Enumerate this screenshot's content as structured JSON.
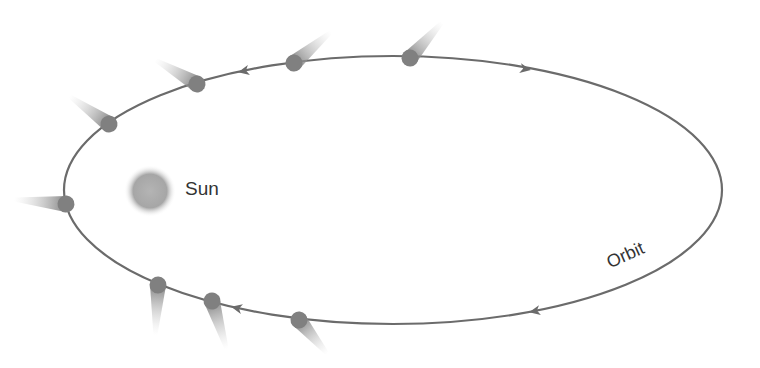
{
  "diagram": {
    "labels": {
      "sun": "Sun",
      "orbit": "Orbit"
    },
    "colors": {
      "orbit_line": "#6b6b6b",
      "comet_head": "#808080",
      "sun": "#a8a8a8",
      "text": "#333333",
      "background": "#ffffff"
    },
    "orbit": {
      "cx": 393,
      "cy": 190,
      "rx": 329,
      "ry": 134
    },
    "sun": {
      "cx": 150,
      "cy": 191,
      "r": 24
    },
    "comets": [
      {
        "x": 410,
        "y": 58,
        "tail_angle": -48,
        "tail_length": 48
      },
      {
        "x": 294,
        "y": 63,
        "tail_angle": -40,
        "tail_length": 48
      },
      {
        "x": 197,
        "y": 84,
        "tail_angle": -150,
        "tail_length": 48
      },
      {
        "x": 109,
        "y": 124,
        "tail_angle": -145,
        "tail_length": 48
      },
      {
        "x": 66,
        "y": 204,
        "tail_angle": 185,
        "tail_length": 52
      },
      {
        "x": 158,
        "y": 285,
        "tail_angle": 93,
        "tail_length": 50
      },
      {
        "x": 212,
        "y": 301,
        "tail_angle": 73,
        "tail_length": 50
      },
      {
        "x": 299,
        "y": 320,
        "tail_angle": 50,
        "tail_length": 44
      }
    ],
    "arrows": [
      {
        "x": 244,
        "y": 71,
        "direction": "left"
      },
      {
        "x": 525,
        "y": 69,
        "direction": "right"
      },
      {
        "x": 535,
        "y": 311,
        "direction": "left"
      },
      {
        "x": 237,
        "y": 308,
        "direction": "left"
      }
    ]
  }
}
